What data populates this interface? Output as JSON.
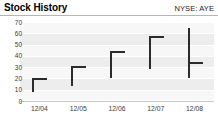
{
  "widget": {
    "title": "Stock History",
    "ticker": "NYSE: AYE"
  },
  "chart_data": {
    "type": "bar",
    "subtype": "high-low-close",
    "title": "Stock History",
    "annotation": "NYSE: AYE",
    "xlabel": "",
    "ylabel": "",
    "ylim": [
      0,
      70
    ],
    "yticks": [
      0,
      10,
      20,
      30,
      40,
      50,
      60,
      70
    ],
    "ytick_labels": [
      "0",
      "10",
      "20",
      "30",
      "40",
      "50",
      "60",
      "70"
    ],
    "categories": [
      "12/04",
      "12/05",
      "12/06",
      "12/07",
      "12/08"
    ],
    "grid": true,
    "grid_orientation": "horizontal",
    "legend": false,
    "bar_color": "#2b2b2b",
    "plot_background": "#ededed",
    "series": [
      {
        "name": "High",
        "values": [
          20,
          31,
          44,
          58,
          65
        ]
      },
      {
        "name": "Low",
        "values": [
          8,
          13,
          20,
          28,
          20
        ]
      },
      {
        "name": "Close",
        "values": [
          20,
          31,
          44,
          58,
          35
        ]
      }
    ],
    "points": [
      {
        "x": "12/04",
        "high": 20,
        "low": 8,
        "close": 20
      },
      {
        "x": "12/05",
        "high": 31,
        "low": 13,
        "close": 31
      },
      {
        "x": "12/06",
        "high": 44,
        "low": 20,
        "close": 44
      },
      {
        "x": "12/07",
        "high": 58,
        "low": 28,
        "close": 58
      },
      {
        "x": "12/08",
        "high": 65,
        "low": 20,
        "close": 35
      }
    ]
  }
}
